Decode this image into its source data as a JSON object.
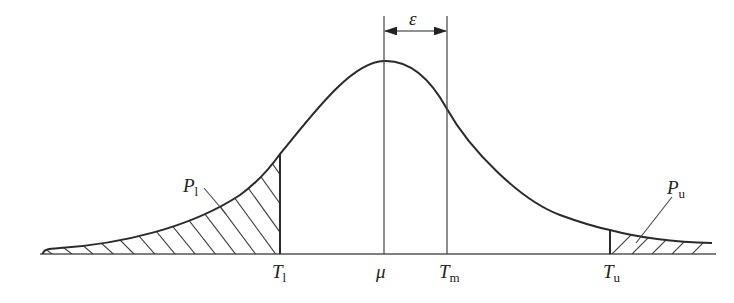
{
  "figure": {
    "type": "probability-density-diagram",
    "colors": {
      "line": "#2a2a2a",
      "hatch": "#3a3a3a",
      "background": "#ffffff"
    }
  },
  "labels": {
    "epsilon": "ε",
    "mu": "μ",
    "T_l": {
      "main": "T",
      "sub": "l"
    },
    "T_m": {
      "main": "T",
      "sub": "m"
    },
    "T_u": {
      "main": "T",
      "sub": "u"
    },
    "P_l": {
      "main": "P",
      "sub": "l"
    },
    "P_u": {
      "main": "P",
      "sub": "u"
    }
  },
  "geometry": {
    "baseline_y": 254,
    "x_start": 43,
    "x_end": 712,
    "x_Tl": 280,
    "x_mu": 384,
    "x_Tm": 447,
    "x_Tu": 610,
    "peak_y": 61
  }
}
